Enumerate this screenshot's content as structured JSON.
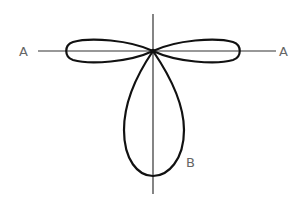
{
  "diagram": {
    "type": "radiation-pattern",
    "labels": {
      "axis_left": "A",
      "axis_right": "A",
      "lobe_bottom": "B"
    },
    "colors": {
      "line": "#111111",
      "axis": "#333333",
      "label": "#666666",
      "background": "#ffffff"
    },
    "origin": {
      "x": 153,
      "y": 51
    },
    "lobes": [
      {
        "name": "left",
        "tip": {
          "x": 67,
          "y": 51
        },
        "half_width": 11
      },
      {
        "name": "right",
        "tip": {
          "x": 240,
          "y": 51
        },
        "half_width": 11
      },
      {
        "name": "bottom",
        "tip": {
          "x": 153,
          "y": 176
        },
        "half_width": 30
      }
    ]
  }
}
